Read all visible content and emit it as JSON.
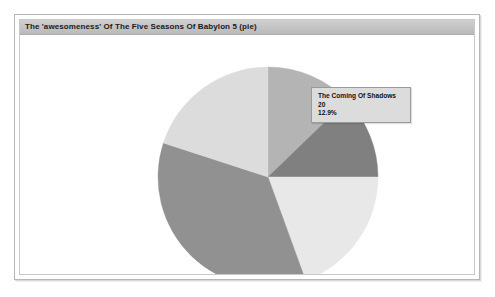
{
  "window": {
    "title": "The 'awesomeness' Of The Five Seasons Of Babylon 5 (pie)"
  },
  "tooltip": {
    "label": "The Coming Of Shadows",
    "value": "20",
    "percent": "12.9%"
  },
  "chart_data": {
    "type": "pie",
    "title": "The 'awesomeness' Of The Five Seasons Of Babylon 5 (pie)",
    "xlabel": "",
    "ylabel": "",
    "legend": false,
    "grid": false,
    "total": 155,
    "categories": [
      "The Coming Of Shadows",
      "Season 3",
      "Season 4",
      "Season 5",
      "Season 1"
    ],
    "values": [
      20,
      19,
      30,
      55,
      31
    ],
    "percents": [
      "12.9%",
      "12.3%",
      "19.4%",
      "35.5%",
      "20.0%"
    ],
    "colors": [
      "#b4b4b4",
      "#808080",
      "#e8e8e8",
      "#919191",
      "#dcdcdc"
    ],
    "highlighted": "The Coming Of Shadows",
    "start_angle_deg": 0,
    "direction": "clockwise",
    "slices": [
      {
        "label": "The Coming Of Shadows",
        "value": 20,
        "percent": "12.9%",
        "color": "#b4b4b4",
        "start_deg": 0,
        "end_deg": 46
      },
      {
        "label": "Season 3",
        "value": 19,
        "percent": "12.3%",
        "color": "#808080",
        "start_deg": 46,
        "end_deg": 90
      },
      {
        "label": "Season 4",
        "value": 30,
        "percent": "19.4%",
        "color": "#e8e8e8",
        "start_deg": 90,
        "end_deg": 160
      },
      {
        "label": "Season 5",
        "value": 55,
        "percent": "35.5%",
        "color": "#919191",
        "start_deg": 160,
        "end_deg": 288
      },
      {
        "label": "Season 1",
        "value": 31,
        "percent": "20.0%",
        "color": "#dcdcdc",
        "start_deg": 288,
        "end_deg": 360
      }
    ],
    "geometry": {
      "cx": 248,
      "cy": 142,
      "r": 110
    }
  }
}
